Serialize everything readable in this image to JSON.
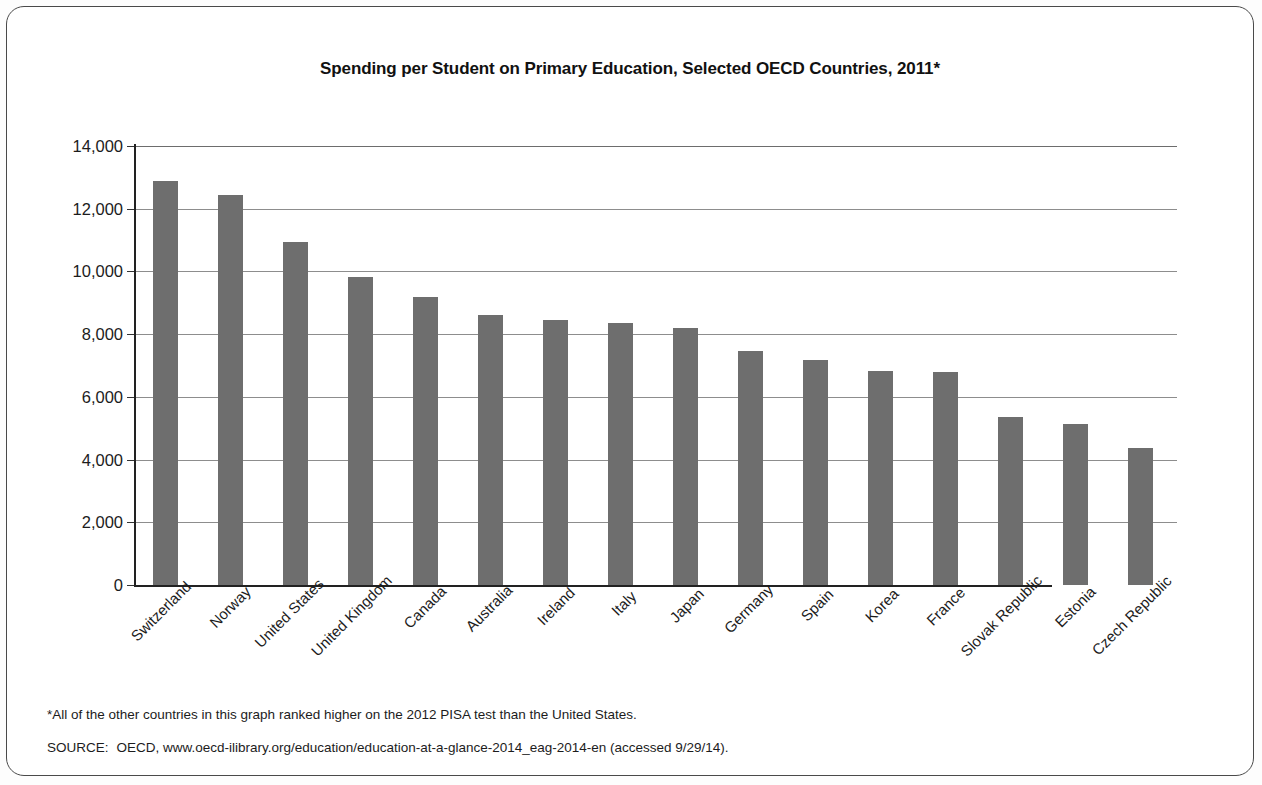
{
  "chart_data": {
    "type": "bar",
    "title": "Spending per Student on Primary Education, Selected OECD Countries, 2011*",
    "xlabel": "",
    "ylabel": "",
    "ylim": [
      0,
      14000
    ],
    "grid": true,
    "legend": "none",
    "orientation": "vertical",
    "bar_color": "#6e6e6e",
    "categories": [
      "Switzerland",
      "Norway",
      "United States",
      "United Kingdom",
      "Canada",
      "Australia",
      "Ireland",
      "Italy",
      "Japan",
      "Germany",
      "Spain",
      "Korea",
      "France",
      "Slovak Republic",
      "Estonia",
      "Czech Republic"
    ],
    "values": [
      12900,
      12450,
      10930,
      9820,
      9200,
      8620,
      8460,
      8370,
      8200,
      7470,
      7170,
      6840,
      6780,
      5350,
      5120,
      4380
    ],
    "ytick_values": [
      0,
      2000,
      4000,
      6000,
      8000,
      10000,
      12000,
      14000
    ],
    "ytick_labels": [
      "0",
      "2,000",
      "4,000",
      "6,000",
      "8,000",
      "10,000",
      "12,000",
      "14,000"
    ]
  },
  "notes": {
    "footnote": "*All of the other countries in this graph ranked higher on the 2012 PISA test than the United States.",
    "source_label": "SOURCE:",
    "source_text": "OECD, www.oecd-ilibrary.org/education/education-at-a-glance-2014_eag-2014-en (accessed 9/29/14)."
  }
}
